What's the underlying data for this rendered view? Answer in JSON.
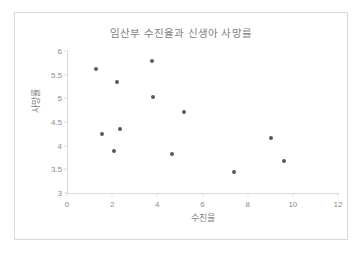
{
  "chart_data": {
    "type": "scatter",
    "title": "임산부 수진율과 신생아 사망률",
    "xlabel": "수진율",
    "ylabel": "사망률",
    "xlim": [
      0,
      12
    ],
    "ylim": [
      3,
      6
    ],
    "xticks": [
      "0",
      "2",
      "4",
      "6",
      "8",
      "10",
      "12"
    ],
    "xtick_values": [
      0,
      2,
      4,
      6,
      8,
      10,
      12
    ],
    "yticks": [
      "3",
      "3.5",
      "4",
      "4.5",
      "5",
      "5.5",
      "6"
    ],
    "ytick_values": [
      3,
      3.5,
      4,
      4.5,
      5,
      5.5,
      6
    ],
    "grid": false,
    "legend": false,
    "marker_color": "#595959",
    "axis_color": "#d9d9d9",
    "text_color": "#808080",
    "series": [
      {
        "name": "관측값",
        "points": [
          {
            "x": 1.3,
            "y": 5.62
          },
          {
            "x": 1.55,
            "y": 4.25
          },
          {
            "x": 2.1,
            "y": 3.89
          },
          {
            "x": 2.2,
            "y": 5.34
          },
          {
            "x": 2.35,
            "y": 4.36
          },
          {
            "x": 3.75,
            "y": 5.79
          },
          {
            "x": 3.8,
            "y": 5.03
          },
          {
            "x": 4.65,
            "y": 3.83
          },
          {
            "x": 5.2,
            "y": 4.72
          },
          {
            "x": 7.4,
            "y": 3.45
          },
          {
            "x": 9.05,
            "y": 4.16
          },
          {
            "x": 9.6,
            "y": 3.67
          }
        ]
      }
    ]
  }
}
